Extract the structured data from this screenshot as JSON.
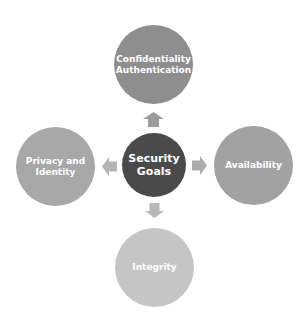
{
  "diagram": {
    "center": {
      "label": "Security Goals",
      "lines": [
        "Security",
        "Goals"
      ],
      "color": "#4a4a4a"
    },
    "nodes": [
      {
        "position": "top",
        "lines": [
          "Confidentiality",
          "Authentication"
        ],
        "color": "#8e8e8e"
      },
      {
        "position": "right",
        "lines": [
          "Availability"
        ],
        "color": "#a2a2a2"
      },
      {
        "position": "bottom",
        "lines": [
          "Integrity"
        ],
        "color": "#c6c6c6"
      },
      {
        "position": "left",
        "lines": [
          "Privacy and",
          "Identity"
        ],
        "color": "#a8a8a8"
      }
    ],
    "arrow_color": "#9c9c9c"
  }
}
